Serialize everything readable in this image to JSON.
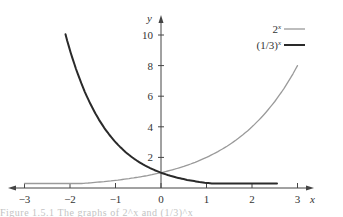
{
  "chart_data": {
    "type": "line",
    "title": "",
    "xlabel": "x",
    "ylabel": "y",
    "xlim": [
      -3,
      3
    ],
    "ylim": [
      0,
      10
    ],
    "grid": false,
    "legend_position": "top-right",
    "x_ticks": [
      -3,
      -2,
      -1,
      0,
      1,
      2,
      3
    ],
    "x_tick_labels": [
      "−3",
      "−2",
      "−1",
      "0",
      "1",
      "2",
      "3"
    ],
    "y_ticks": [
      2,
      4,
      6,
      8,
      10
    ],
    "y_tick_labels": [
      "2",
      "4",
      "6",
      "8",
      "10"
    ],
    "series": [
      {
        "name": "2^x",
        "legend_label": "2",
        "legend_sup": "x",
        "color": "#9a9a9a",
        "line_width": 1.3,
        "x_range": [
          -3,
          3
        ],
        "x": [
          -3,
          -2,
          -1,
          0,
          1,
          2,
          3
        ],
        "values": [
          0.125,
          0.25,
          0.5,
          1,
          2,
          4,
          8
        ]
      },
      {
        "name": "(1/3)^x",
        "legend_label": "(1/3)",
        "legend_sup": "x",
        "color": "#2a2a2a",
        "line_width": 2,
        "x_range": [
          -2.1,
          2.55
        ],
        "x": [
          -2,
          -1,
          0,
          1,
          2
        ],
        "values": [
          9,
          3,
          1,
          0.333,
          0.111
        ]
      }
    ],
    "annotations": [
      {
        "text": "intersection at (0, 1)"
      }
    ]
  },
  "caption": {
    "text": "Figure 1.5.1  The graphs of 2^x and (1/3)^x"
  }
}
